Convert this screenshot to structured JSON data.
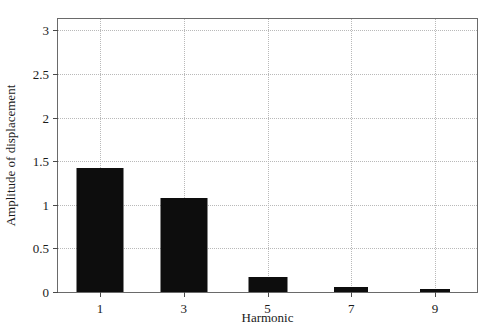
{
  "chart_data": {
    "type": "bar",
    "title": "",
    "xlabel": "Harmonic",
    "ylabel": "Amplitude of displacement",
    "categories": [
      "1",
      "3",
      "5",
      "7",
      "9"
    ],
    "values": [
      1.42,
      1.08,
      0.17,
      0.06,
      0.03
    ],
    "series": [
      {
        "name": "Amplitude of displacement",
        "values": [
          1.42,
          1.08,
          0.17,
          0.06,
          0.03
        ]
      }
    ],
    "ylim": [
      0,
      3.13
    ],
    "xlim": [
      0,
      10
    ],
    "yticks": [
      0,
      0.5,
      1,
      1.5,
      2,
      2.5,
      3
    ],
    "ytick_labels": [
      "0",
      "0.5",
      "1",
      "1.5",
      "2",
      "2.5",
      "3"
    ],
    "xticks": [
      1,
      3,
      5,
      7,
      9
    ],
    "xtick_labels": [
      "1",
      "3",
      "5",
      "7",
      "9"
    ],
    "grid": true,
    "grid_style": "dotted",
    "legend": null,
    "legend_position": "none",
    "bar_color": "#0d0d0d",
    "grid_color": "#b9b9b9",
    "axis_color": "#6a6a6a",
    "background_color": "#ffffff"
  }
}
